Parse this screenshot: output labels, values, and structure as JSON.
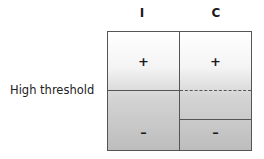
{
  "columns": [
    {
      "label": "I"
    },
    {
      "label": "C"
    }
  ],
  "rows": {
    "threshold_label": "High threshold"
  },
  "panels": {
    "I": {
      "upper_sign": "+",
      "lower_sign": "–",
      "threshold_line": "solid"
    },
    "C": {
      "upper_sign": "+",
      "lower_sign": "–",
      "threshold_line": "dashed",
      "shifted_line": "solid"
    }
  },
  "colors": {
    "border": "#555555",
    "gradient_top": "#ffffff",
    "gradient_bottom": "#bdbdbd"
  }
}
